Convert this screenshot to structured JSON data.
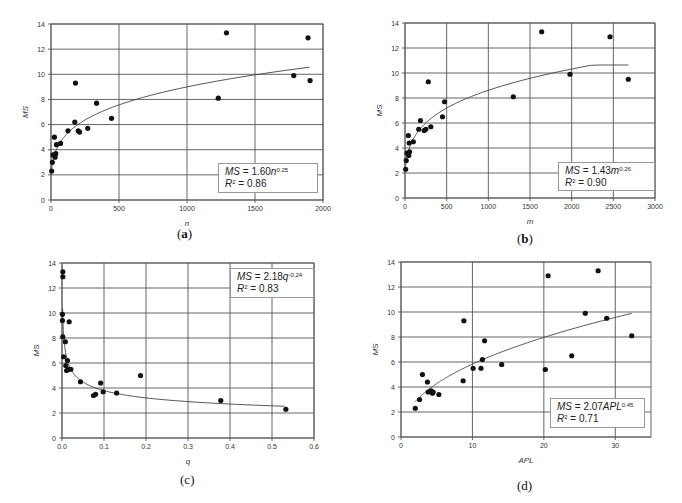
{
  "chart_data": [
    {
      "id": "a",
      "type": "scatter",
      "caption": "a",
      "xlabel": "n",
      "ylabel": "MS",
      "xlim": [
        0,
        2000
      ],
      "ylim": [
        0,
        14
      ],
      "xticks": [
        0,
        500,
        1000,
        1500,
        2000
      ],
      "yticks": [
        0,
        2,
        4,
        6,
        8,
        10,
        12,
        14
      ],
      "grid": true,
      "legend": {
        "eq_prefix": "MS",
        "eq_body": " = 1.60",
        "var": "n",
        "exp": "0.25",
        "r2_label": "R",
        "r2_value": " = 0.86"
      },
      "fit": {
        "form": "power",
        "a": 1.6,
        "b": 0.25,
        "x_range": [
          5,
          1900
        ]
      },
      "points": [
        [
          5,
          2.3
        ],
        [
          10,
          3.0
        ],
        [
          15,
          3.6
        ],
        [
          25,
          5.0
        ],
        [
          30,
          3.6
        ],
        [
          35,
          3.7
        ],
        [
          30,
          3.4
        ],
        [
          40,
          4.4
        ],
        [
          70,
          4.5
        ],
        [
          125,
          5.5
        ],
        [
          175,
          6.2
        ],
        [
          180,
          9.3
        ],
        [
          200,
          5.5
        ],
        [
          210,
          5.4
        ],
        [
          270,
          5.7
        ],
        [
          335,
          7.7
        ],
        [
          445,
          6.5
        ],
        [
          1230,
          8.1
        ],
        [
          1290,
          13.3
        ],
        [
          1785,
          9.9
        ],
        [
          1890,
          12.9
        ],
        [
          1905,
          9.5
        ]
      ]
    },
    {
      "id": "b",
      "type": "scatter",
      "caption": "b",
      "xlabel": "m",
      "ylabel": "MS",
      "xlim": [
        0,
        3000
      ],
      "ylim": [
        0,
        14
      ],
      "xticks": [
        0,
        500,
        1000,
        1500,
        2000,
        2500,
        3000
      ],
      "yticks": [
        0,
        2,
        4,
        6,
        8,
        10,
        12,
        14
      ],
      "grid": true,
      "legend": {
        "eq_prefix": "MS",
        "eq_body": " = 1.43",
        "var": "m",
        "exp": "0.26",
        "r2_label": "R",
        "r2_value": " = 0.90"
      },
      "fit": {
        "form": "power",
        "a": 1.43,
        "b": 0.26,
        "x_range": [
          10,
          2680
        ]
      },
      "points": [
        [
          8,
          2.3
        ],
        [
          15,
          3.0
        ],
        [
          25,
          3.6
        ],
        [
          40,
          5.0
        ],
        [
          45,
          3.4
        ],
        [
          55,
          3.7
        ],
        [
          50,
          4.4
        ],
        [
          100,
          4.5
        ],
        [
          165,
          5.5
        ],
        [
          185,
          6.2
        ],
        [
          280,
          9.3
        ],
        [
          230,
          5.4
        ],
        [
          250,
          5.5
        ],
        [
          310,
          5.7
        ],
        [
          450,
          6.5
        ],
        [
          475,
          7.7
        ],
        [
          1300,
          8.1
        ],
        [
          1640,
          13.3
        ],
        [
          1980,
          9.9
        ],
        [
          2460,
          12.9
        ],
        [
          2680,
          9.5
        ]
      ]
    },
    {
      "id": "c",
      "type": "scatter",
      "caption": "c",
      "xlabel": "q",
      "ylabel": "MS",
      "xlim": [
        0.0,
        0.6
      ],
      "ylim": [
        0,
        14
      ],
      "xticks": [
        "0.0",
        "0.1",
        "0.2",
        "0.3",
        "0.4",
        "0.5",
        "0.6"
      ],
      "yticks": [
        0,
        2,
        4,
        6,
        8,
        10,
        12,
        14
      ],
      "grid": true,
      "legend": {
        "eq_prefix": "MS",
        "eq_body": " = 2.18",
        "var": "q",
        "exp": "-0.24",
        "r2_label": "R",
        "r2_value": " = 0.83"
      },
      "fit": {
        "form": "power",
        "a": 2.18,
        "b": -0.24,
        "x_range": [
          0.0015,
          0.53
        ]
      },
      "points": [
        [
          0.002,
          13.3
        ],
        [
          0.002,
          12.9
        ],
        [
          0.001,
          9.9
        ],
        [
          0.001,
          9.4
        ],
        [
          0.002,
          8.1
        ],
        [
          0.017,
          9.3
        ],
        [
          0.008,
          7.7
        ],
        [
          0.004,
          6.5
        ],
        [
          0.009,
          5.8
        ],
        [
          0.013,
          6.2
        ],
        [
          0.011,
          5.4
        ],
        [
          0.015,
          5.5
        ],
        [
          0.021,
          5.5
        ],
        [
          0.044,
          4.5
        ],
        [
          0.092,
          4.4
        ],
        [
          0.075,
          3.4
        ],
        [
          0.08,
          3.5
        ],
        [
          0.098,
          3.7
        ],
        [
          0.13,
          3.6
        ],
        [
          0.187,
          5.0
        ],
        [
          0.378,
          3.0
        ],
        [
          0.533,
          2.3
        ]
      ]
    },
    {
      "id": "d",
      "type": "scatter",
      "caption": "d",
      "xlabel": "APL",
      "ylabel": "MS",
      "xlim": [
        0,
        35
      ],
      "ylim": [
        0,
        14
      ],
      "xticks": [
        0,
        10,
        20,
        30
      ],
      "yticks": [
        0,
        2,
        4,
        6,
        8,
        10,
        12,
        14
      ],
      "grid": true,
      "legend": {
        "eq_prefix": "MS",
        "eq_body": " = 2.07",
        "var": "APL",
        "exp": "0.45",
        "r2_label": "R",
        "r2_value": " = 0.71"
      },
      "fit": {
        "form": "power",
        "a": 2.07,
        "b": 0.45,
        "x_range": [
          2,
          32.3
        ]
      },
      "points": [
        [
          2.0,
          2.3
        ],
        [
          2.6,
          3.0
        ],
        [
          3.0,
          5.0
        ],
        [
          3.7,
          4.4
        ],
        [
          3.8,
          3.6
        ],
        [
          4.2,
          3.7
        ],
        [
          4.4,
          3.5
        ],
        [
          4.5,
          3.6
        ],
        [
          5.3,
          3.4
        ],
        [
          8.7,
          4.5
        ],
        [
          8.8,
          9.3
        ],
        [
          10.1,
          5.5
        ],
        [
          11.2,
          5.5
        ],
        [
          11.4,
          6.2
        ],
        [
          11.7,
          7.7
        ],
        [
          14.1,
          5.8
        ],
        [
          20.2,
          5.4
        ],
        [
          20.6,
          12.9
        ],
        [
          23.9,
          6.5
        ],
        [
          25.8,
          9.9
        ],
        [
          27.6,
          13.3
        ],
        [
          28.8,
          9.5
        ],
        [
          32.3,
          8.1
        ]
      ]
    }
  ]
}
